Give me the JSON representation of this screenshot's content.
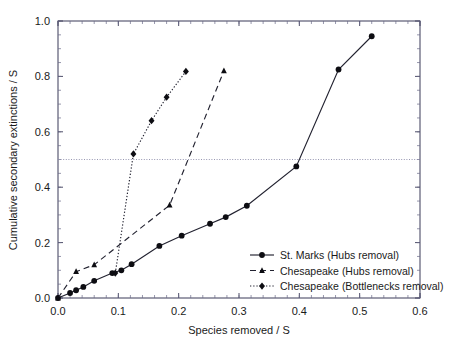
{
  "figure": {
    "background_color": "#ffffff",
    "frame_color": "#3a3a58",
    "ink_color": "#0d0d12"
  },
  "chart_data": {
    "type": "line",
    "title": "",
    "xlabel": "Species removed / S",
    "ylabel": "Cumulative secondary extinctions / S",
    "xlim": [
      0.0,
      0.6
    ],
    "ylim": [
      0.0,
      1.0
    ],
    "xticks": [
      0.0,
      0.1,
      0.2,
      0.3,
      0.4,
      0.5,
      0.6
    ],
    "xticklabels": [
      "0.0",
      "0.1",
      "0.2",
      "0.3",
      "0.4",
      "0.5",
      "0.6"
    ],
    "yticks": [
      0.0,
      0.2,
      0.4,
      0.6,
      0.8,
      1.0
    ],
    "yticklabels": [
      "0.0",
      "0.2",
      "0.4",
      "0.6",
      "0.8",
      "1.0"
    ],
    "grid": false,
    "minor_ticks": true,
    "reference_lines": [
      {
        "name": "half-extinction-line",
        "orientation": "horizontal",
        "y": 0.5,
        "style": "dotted",
        "color": "#8a8aa8"
      }
    ],
    "legend_position": "lower right",
    "series": [
      {
        "name": "St. Marks (Hubs removal)",
        "marker": "circle",
        "linestyle": "solid",
        "color": "#222230",
        "points": [
          [
            0.0,
            0.0
          ],
          [
            0.02,
            0.018
          ],
          [
            0.03,
            0.028
          ],
          [
            0.042,
            0.04
          ],
          [
            0.06,
            0.062
          ],
          [
            0.09,
            0.09
          ],
          [
            0.105,
            0.1
          ],
          [
            0.122,
            0.122
          ],
          [
            0.168,
            0.188
          ],
          [
            0.205,
            0.225
          ],
          [
            0.252,
            0.268
          ],
          [
            0.278,
            0.292
          ],
          [
            0.313,
            0.333
          ],
          [
            0.395,
            0.475
          ],
          [
            0.465,
            0.825
          ],
          [
            0.52,
            0.945
          ]
        ]
      },
      {
        "name": "Chesapeake (Hubs removal)",
        "marker": "triangle",
        "linestyle": "dashed",
        "color": "#222230",
        "points": [
          [
            0.0,
            0.0
          ],
          [
            0.03,
            0.095
          ],
          [
            0.06,
            0.12
          ],
          [
            0.185,
            0.335
          ],
          [
            0.275,
            0.82
          ]
        ]
      },
      {
        "name": "Chesapeake (Bottlenecks removal)",
        "marker": "diamond",
        "linestyle": "dotted",
        "color": "#222230",
        "points": [
          [
            0.095,
            0.09
          ],
          [
            0.125,
            0.52
          ],
          [
            0.155,
            0.64
          ],
          [
            0.18,
            0.725
          ],
          [
            0.212,
            0.818
          ]
        ]
      }
    ]
  },
  "legend": {
    "entries": [
      {
        "label": "St. Marks (Hubs removal)",
        "marker": "circle",
        "linestyle": "solid"
      },
      {
        "label": "Chesapeake (Hubs removal)",
        "marker": "triangle",
        "linestyle": "dashed"
      },
      {
        "label": "Chesapeake (Bottlenecks removal)",
        "marker": "diamond",
        "linestyle": "dotted"
      }
    ]
  }
}
